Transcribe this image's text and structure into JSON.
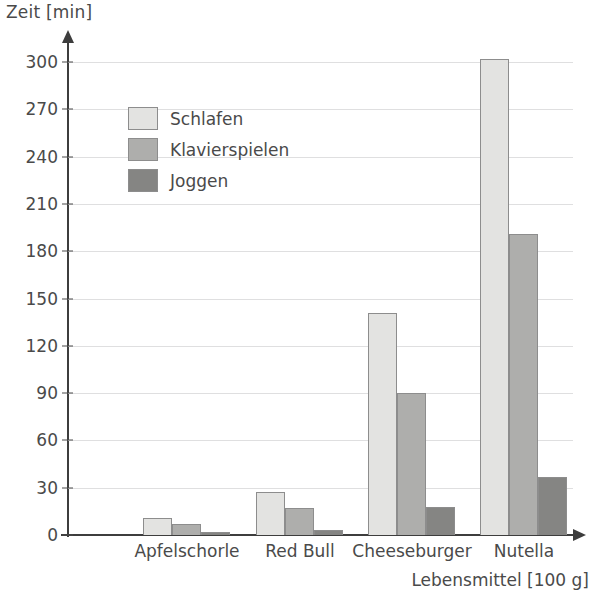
{
  "chart_data": {
    "type": "bar",
    "title": "",
    "xlabel": "Lebensmittel [100 g]",
    "ylabel": "Zeit [min]",
    "categories": [
      "Apfelschorle",
      "Red Bull",
      "Cheeseburger",
      "Nutella"
    ],
    "series": [
      {
        "name": "Schlafen",
        "color": "#e3e3e1",
        "values": [
          11,
          27,
          141,
          302
        ]
      },
      {
        "name": "Klavierspielen",
        "color": "#aeaeac",
        "values": [
          7,
          17,
          90,
          191
        ]
      },
      {
        "name": "Joggen",
        "color": "#858583",
        "values": [
          2,
          3,
          18,
          37
        ]
      }
    ],
    "ylim": [
      0,
      300
    ],
    "ytick_step": 30,
    "yticks": [
      0,
      30,
      60,
      90,
      120,
      150,
      180,
      210,
      240,
      270,
      300
    ],
    "grid": true,
    "legend_position": "upper-left-inside"
  },
  "axes": {
    "y_title": "Zeit [min]",
    "x_title": "Lebensmittel [100 g]"
  }
}
